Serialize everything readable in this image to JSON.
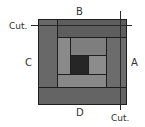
{
  "diagram": {
    "type": "log-cabin quilt block",
    "labels": {
      "top": "B",
      "right": "A",
      "left": "C",
      "bottom": "D",
      "cut_top_left": "Cut.",
      "cut_bottom_right": "Cut."
    },
    "colors": {
      "outer_strip": "#686868",
      "outer_strip_top": "#5e5e5e",
      "inner_strip": "#8a8a8a",
      "inner_strip_top": "#7e7e7e",
      "center": "#262626",
      "border": "#1e1e1e",
      "background": "#ffffff"
    }
  }
}
